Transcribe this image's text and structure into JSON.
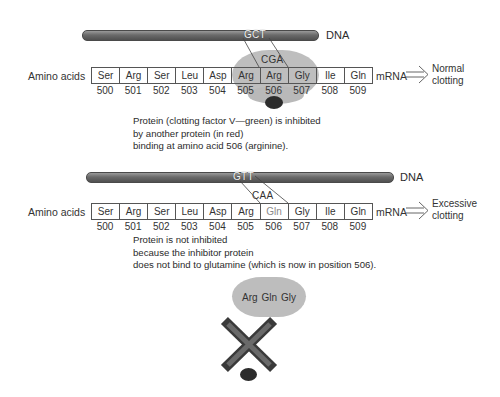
{
  "normal": {
    "dna_label": "DNA",
    "dna_codon": "GCT",
    "mrna_codon": "CGA",
    "row_label": "Amino acids",
    "amino_acids": [
      "Ser",
      "Arg",
      "Ser",
      "Leu",
      "Asp",
      "Arg",
      "Arg",
      "Gly",
      "Ile",
      "Gln"
    ],
    "positions": [
      "500",
      "501",
      "502",
      "503",
      "504",
      "505",
      "506",
      "507",
      "508",
      "509"
    ],
    "mrna_label": "mRNA",
    "outcome_line1": "Normal",
    "outcome_line2": "clotting",
    "caption_line1": "Protein (clotting factor V—green) is inhibited",
    "caption_line2": "by another protein (in red)",
    "caption_line3": "binding at amino acid 506 (arginine)."
  },
  "mutant": {
    "dna_label": "DNA",
    "dna_codon": "GTT",
    "mrna_codon": "CAA",
    "row_label": "Amino acids",
    "amino_acids": [
      "Ser",
      "Arg",
      "Ser",
      "Leu",
      "Asp",
      "Arg",
      "Gln",
      "Gly",
      "Ile",
      "Gln"
    ],
    "positions": [
      "500",
      "501",
      "502",
      "503",
      "504",
      "505",
      "506",
      "507",
      "508",
      "509"
    ],
    "mrna_label": "mRNA",
    "outcome_line1": "Excessive",
    "outcome_line2": "clotting",
    "caption_line1": "Protein is not inhibited",
    "caption_line2": "because the inhibitor protein",
    "caption_line3": "does not bind to glutamine (which is now in position 506).",
    "protein_fragment": [
      "Arg",
      "Gln",
      "Gly"
    ]
  },
  "colors": {
    "protein": "#b9b9b9",
    "inhibitor": "#2c2c2c",
    "dna": "#6a6a6a",
    "cross": "#555555"
  }
}
